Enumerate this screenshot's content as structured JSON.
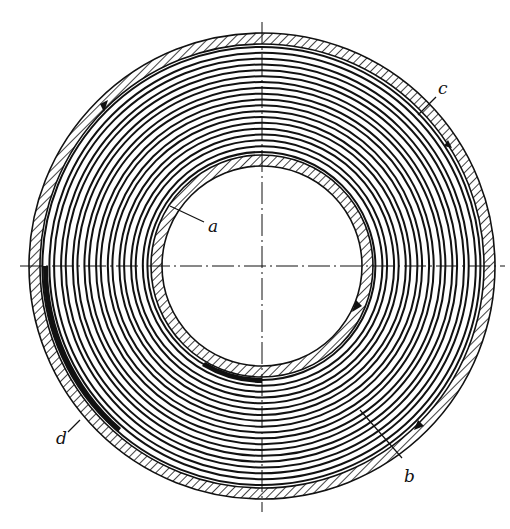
{
  "figure": {
    "type": "technical cross-section drawing",
    "colors": {
      "ink": "#111111",
      "background": "#ffffff"
    },
    "geometry": {
      "center": [
        262,
        266
      ],
      "outer_tube_outer_radius": 233,
      "outer_tube_inner_radius": 222,
      "inner_tube_outer_radius": 111,
      "inner_tube_inner_radius": 100,
      "winding_turns": 18
    },
    "labels": [
      {
        "id": "a",
        "text": "a",
        "x": 210,
        "y": 230
      },
      {
        "id": "b",
        "text": "b",
        "x": 405,
        "y": 480
      },
      {
        "id": "c",
        "text": "c",
        "x": 440,
        "y": 92
      },
      {
        "id": "d",
        "text": "d",
        "x": 60,
        "y": 443
      }
    ]
  }
}
